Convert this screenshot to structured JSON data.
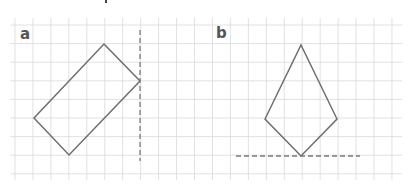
{
  "panels": [
    {
      "label": "a",
      "shape": "rectangle (rotated 45°-ish)",
      "vertices": [
        [
          104,
          44
        ],
        [
          140,
          81
        ],
        [
          69,
          155
        ],
        [
          34,
          118
        ]
      ],
      "mirror_line": {
        "orientation": "vertical",
        "x": 140,
        "y1": 30,
        "y2": 161
      }
    },
    {
      "label": "b",
      "shape": "kite",
      "vertices": [
        [
          301,
          45
        ],
        [
          337,
          119
        ],
        [
          301,
          156
        ],
        [
          265,
          119
        ]
      ],
      "mirror_line": {
        "orientation": "horizontal",
        "y": 156,
        "x1": 236,
        "x2": 360
      }
    }
  ],
  "grid": {
    "x_start": 15,
    "x_step": 17.95,
    "x_count": 22,
    "y_start": 25,
    "y_step": 18.6,
    "y_count": 9,
    "x_min": 10,
    "x_max": 402,
    "y_min": 18,
    "y_max": 180,
    "color": "#d9d9d9"
  },
  "colors": {
    "shape": "#6e6e6e",
    "mirror": "#7a7a7a",
    "label": "#555555"
  }
}
